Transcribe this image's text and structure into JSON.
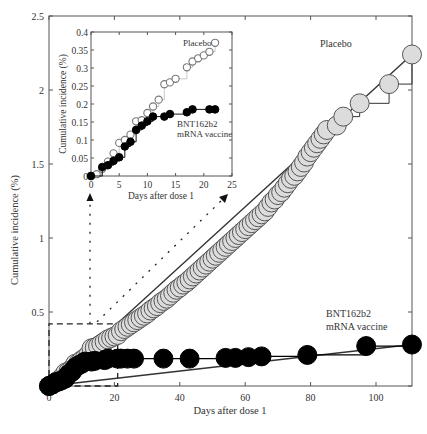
{
  "chart_data": [
    {
      "id": "main",
      "type": "scatter",
      "title": "",
      "xlabel": "Days after dose 1",
      "ylabel": "Cumulative incidence (%)",
      "xlim": [
        -1,
        111
      ],
      "ylim": [
        0,
        2.5
      ],
      "xticks": [
        0,
        20,
        40,
        60,
        80,
        100
      ],
      "xtick_labels": [
        "0",
        "20",
        "40",
        "60",
        "80",
        "100"
      ],
      "yticks": [
        0,
        0.5,
        1,
        1.5,
        2,
        2.5
      ],
      "ytick_labels": [
        "0",
        "0.5",
        "1",
        "1.5",
        "2",
        "2.5"
      ],
      "grid": false,
      "annotations": [
        {
          "text": "Placebo",
          "x": 82,
          "y": 2.18
        },
        {
          "text": "BNT162b2",
          "x": 90,
          "y": 0.43
        },
        {
          "text": "mRNA vaccine",
          "x": 90,
          "y": 0.35
        }
      ],
      "series": [
        {
          "name": "Placebo",
          "marker": "open-gray-circle",
          "color": "#d9d9d9",
          "edge": "#555555",
          "x": [
            0,
            1,
            2,
            3,
            4,
            5,
            6,
            7,
            8,
            9,
            10,
            11,
            12,
            13,
            14,
            15,
            16,
            17,
            18,
            19,
            20,
            21,
            22,
            23,
            24,
            25,
            26,
            27,
            28,
            29,
            30,
            31,
            32,
            33,
            34,
            35,
            36,
            37,
            38,
            39,
            40,
            41,
            42,
            43,
            44,
            45,
            46,
            47,
            48,
            49,
            50,
            51,
            52,
            53,
            54,
            55,
            56,
            57,
            58,
            59,
            60,
            61,
            62,
            63,
            64,
            65,
            66,
            67,
            68,
            69,
            70,
            71,
            72,
            73,
            74,
            75,
            76,
            77,
            78,
            79,
            80,
            81,
            82,
            83,
            84,
            85,
            88,
            90,
            95,
            104,
            111
          ],
          "y": [
            0.0,
            0.01,
            0.025,
            0.04,
            0.06,
            0.09,
            0.1,
            0.115,
            0.15,
            0.155,
            0.175,
            0.19,
            0.21,
            0.255,
            0.26,
            0.27,
            0.285,
            0.3,
            0.315,
            0.325,
            0.335,
            0.345,
            0.37,
            0.385,
            0.4,
            0.415,
            0.43,
            0.445,
            0.46,
            0.475,
            0.49,
            0.51,
            0.525,
            0.54,
            0.56,
            0.575,
            0.59,
            0.61,
            0.63,
            0.65,
            0.665,
            0.685,
            0.7,
            0.72,
            0.74,
            0.76,
            0.78,
            0.8,
            0.82,
            0.84,
            0.86,
            0.88,
            0.9,
            0.92,
            0.94,
            0.96,
            0.98,
            1.0,
            1.02,
            1.04,
            1.06,
            1.08,
            1.1,
            1.12,
            1.14,
            1.16,
            1.18,
            1.21,
            1.24,
            1.26,
            1.29,
            1.31,
            1.34,
            1.37,
            1.4,
            1.42,
            1.45,
            1.48,
            1.51,
            1.55,
            1.58,
            1.61,
            1.64,
            1.67,
            1.7,
            1.73,
            1.76,
            1.82,
            1.91,
            2.04,
            2.24
          ]
        },
        {
          "name": "BNT162b2 mRNA vaccine",
          "marker": "filled-black-circle",
          "color": "#000000",
          "x": [
            0,
            1,
            2,
            3,
            4,
            5,
            6,
            7,
            8,
            9,
            10,
            11,
            13,
            14,
            17,
            18,
            21,
            22,
            24,
            26,
            35,
            43,
            54,
            57,
            61,
            65,
            79,
            97,
            111
          ],
          "y": [
            0.0,
            0.01,
            0.025,
            0.03,
            0.04,
            0.05,
            0.08,
            0.095,
            0.125,
            0.14,
            0.15,
            0.165,
            0.165,
            0.17,
            0.175,
            0.185,
            0.185,
            0.185,
            0.185,
            0.185,
            0.185,
            0.185,
            0.19,
            0.19,
            0.195,
            0.2,
            0.21,
            0.27,
            0.28
          ]
        }
      ],
      "reference_lines": [
        {
          "name": "placebo-trend",
          "x": [
            0,
            111
          ],
          "y": [
            0,
            2.24
          ]
        },
        {
          "name": "vaccine-trend",
          "x": [
            0,
            111
          ],
          "y": [
            0,
            0.28
          ]
        }
      ],
      "zoom_box": {
        "x": [
          -1,
          21
        ],
        "y": [
          0,
          0.42
        ]
      }
    },
    {
      "id": "inset",
      "type": "scatter",
      "title": "",
      "xlabel": "Days after dose 1",
      "ylabel": "Cumulative incidence (%)",
      "xlim": [
        0,
        25
      ],
      "ylim": [
        0,
        0.4
      ],
      "xticks": [
        0,
        5,
        10,
        15,
        20,
        25
      ],
      "xtick_labels": [
        "0",
        "5",
        "10",
        "15",
        "20",
        "25"
      ],
      "yticks": [
        0,
        0.05,
        0.1,
        0.15,
        0.2,
        0.25,
        0.3,
        0.35,
        0.4
      ],
      "ytick_labels": [
        "0",
        "0.05",
        "0.1",
        "0.15",
        "0.2",
        "0.25",
        "0.3",
        "0.35",
        "0.4"
      ],
      "grid": false,
      "annotations": [
        {
          "text": "Placebo",
          "x": 16.2,
          "y": 0.37
        },
        {
          "text": "BNT162b2",
          "x": 14.9,
          "y": 0.155
        },
        {
          "text": "mRNA vaccine",
          "x": 14.9,
          "y": 0.13
        }
      ],
      "series": [
        {
          "name": "Placebo",
          "marker": "open-gray-circle",
          "x": [
            0,
            1,
            2,
            3,
            4,
            5,
            6,
            7,
            8,
            9,
            10,
            11,
            12,
            13,
            14,
            15,
            17,
            18,
            19,
            20,
            21,
            22
          ],
          "y": [
            0.0,
            0.005,
            0.02,
            0.04,
            0.063,
            0.092,
            0.1,
            0.115,
            0.152,
            0.155,
            0.175,
            0.193,
            0.212,
            0.255,
            0.26,
            0.27,
            0.302,
            0.318,
            0.327,
            0.335,
            0.345,
            0.37
          ]
        },
        {
          "name": "BNT162b2 mRNA vaccine",
          "marker": "filled-black-circle",
          "x": [
            0,
            2,
            3,
            4,
            5,
            6,
            7,
            8,
            9,
            10,
            11,
            13,
            14,
            17,
            18,
            21,
            22
          ],
          "y": [
            0.0,
            0.025,
            0.03,
            0.042,
            0.052,
            0.082,
            0.095,
            0.128,
            0.14,
            0.152,
            0.165,
            0.165,
            0.172,
            0.177,
            0.185,
            0.185,
            0.185
          ]
        }
      ]
    }
  ],
  "labels": {
    "main_xlabel": "Days after dose 1",
    "main_ylabel": "Cumulative incidence (%)",
    "inset_xlabel": "Days after dose 1",
    "inset_ylabel": "Cumulative incidence (%)",
    "placebo": "Placebo",
    "vaccine_line1": "BNT162b2",
    "vaccine_line2": "mRNA vaccine"
  },
  "colors": {
    "axis": "#555555",
    "placebo_fill": "#dcdcdc",
    "placebo_edge": "#555555",
    "vaccine_fill": "#000000",
    "trend_line": "#333333"
  }
}
